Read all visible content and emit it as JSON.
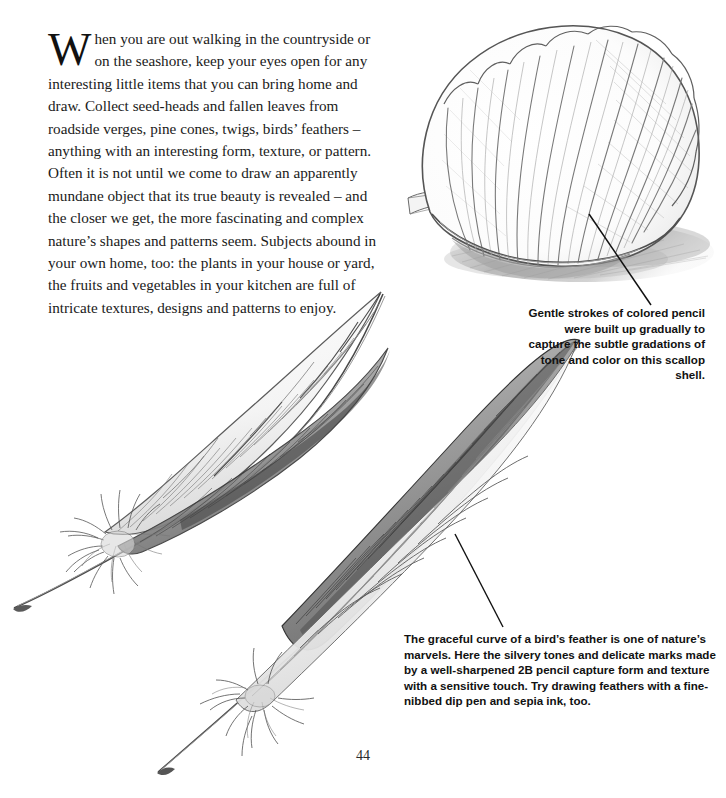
{
  "page": {
    "number": "44",
    "background_color": "#ffffff",
    "ink_color": "#1a1a1a"
  },
  "body": {
    "dropcap": "W",
    "text": "hen you are out walking in the countryside or on the seashore, keep your eyes open for any interesting little items that you can bring home and draw. Collect seed-heads and fallen leaves from roadside verges, pine cones, twigs, birds’ feathers – anything with an interesting form, texture, or pattern. Often it is not until we come to draw an apparently mundane object that its true beauty is revealed – and the closer we get, the more fascinating and complex nature’s shapes and patterns seem. Subjects abound in your own home, too: the plants in your house or yard, the fruits and vegetables in your kitchen are full of intricate textures, designs and patterns to enjoy."
  },
  "captions": {
    "shell": {
      "text": "Gentle strokes of colored pencil were built up gradually to capture the subtle gradations of tone and color on this scallop shell.",
      "align": "right"
    },
    "feather": {
      "text": "The graceful curve of a bird’s feather is one of nature’s marvels. Here the silvery tones and delicate marks made by a well-sharpened 2B pencil capture form and texture with a sensitive touch. Try drawing feathers with a fine-nibbed dip pen and sepia ink, too.",
      "align": "left"
    }
  },
  "illustrations": {
    "shell": {
      "name": "scallop-shell-pencil-drawing",
      "medium": "colored pencil",
      "subject": "scallop shell"
    },
    "feather_upper": {
      "name": "upper-feather-pencil-drawing",
      "medium": "2B pencil",
      "subject": "bird feather"
    },
    "feather_lower": {
      "name": "lower-feather-pencil-drawing",
      "medium": "2B pencil",
      "subject": "bird feather"
    }
  }
}
